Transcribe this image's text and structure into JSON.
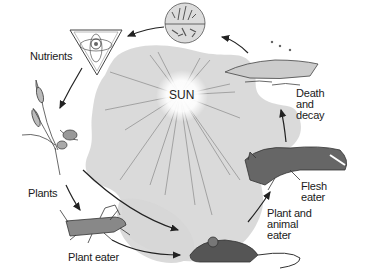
{
  "diagram": {
    "type": "cycle",
    "center": {
      "label": "SUN"
    },
    "nodes": [
      {
        "id": "decomposers",
        "label": "",
        "icon": "soil-microbes-circle"
      },
      {
        "id": "nutrients",
        "label": "Nutrients",
        "icon": "nutrients-triangle"
      },
      {
        "id": "plants",
        "label": "Plants",
        "icon": "wheat-plant"
      },
      {
        "id": "plant-eater",
        "label": "Plant eater",
        "icon": "grasshopper"
      },
      {
        "id": "omnivore",
        "label": "Plant and\nanimal\neater",
        "icon": "mouse"
      },
      {
        "id": "carnivore",
        "label": "Flesh\neater",
        "icon": "fox"
      },
      {
        "id": "death",
        "label": "Death\nand\ndecay",
        "icon": "carcass"
      }
    ],
    "edges": [
      {
        "from": "decomposers",
        "to": "nutrients"
      },
      {
        "from": "nutrients",
        "to": "plants"
      },
      {
        "from": "plants",
        "to": "plant-eater"
      },
      {
        "from": "plants",
        "to": "omnivore"
      },
      {
        "from": "plant-eater",
        "to": "omnivore"
      },
      {
        "from": "omnivore",
        "to": "carnivore"
      },
      {
        "from": "carnivore",
        "to": "death"
      },
      {
        "from": "death",
        "to": "decomposers"
      }
    ],
    "colors": {
      "background": "#ffffff",
      "blob": "#d6d6d6",
      "ink": "#222222",
      "sun_glow": "#ffffff"
    }
  }
}
